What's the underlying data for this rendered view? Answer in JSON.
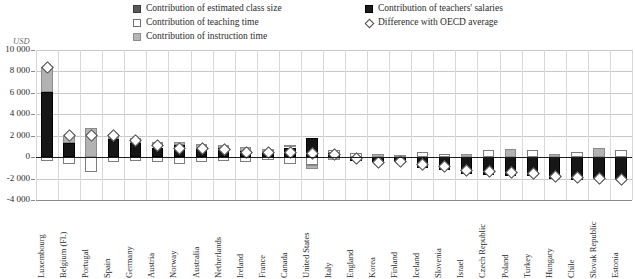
{
  "legend": {
    "items": [
      {
        "id": "class-size",
        "label": "Contribution of estimated class size",
        "swatch": "class"
      },
      {
        "id": "teaching-time",
        "label": "Contribution of teaching time",
        "swatch": "teach"
      },
      {
        "id": "instruction-time",
        "label": "Contribution of instruction time",
        "swatch": "instr"
      },
      {
        "id": "salaries",
        "label": "Contribution of teachers' salaries",
        "swatch": "sal"
      },
      {
        "id": "oecd-diff",
        "label": "Difference with OECD average",
        "swatch": "diamond"
      }
    ]
  },
  "axis": {
    "unit": "USD",
    "yticks": [
      "10 000",
      "8 000",
      "6 000",
      "4 000",
      "2 000",
      "0",
      "-2 000",
      "-4 000"
    ]
  },
  "colors": {
    "class_size": "#5b5b5b",
    "teaching_time": "#fdfdfd",
    "instruction_time": "#b2b2b2",
    "salaries": "#161616",
    "zero_line": "#1d1d1d",
    "gridline": "#c8c8c8"
  },
  "chart_data": {
    "type": "bar",
    "title": "",
    "xlabel": "",
    "ylabel": "USD",
    "ylim": [
      -4000,
      10000
    ],
    "ytick_step": 2000,
    "grid": true,
    "legend_position": "top",
    "stacked": true,
    "categories": [
      "Luxembourg",
      "Belgium (Fl.)",
      "Portugal",
      "Spain",
      "Germany",
      "Austria",
      "Norway",
      "Australia",
      "Netherlands",
      "Ireland",
      "France",
      "Canada",
      "United States",
      "Italy",
      "England",
      "Korea",
      "Finland",
      "Iceland",
      "Slovenia",
      "Israel",
      "Czech Republic",
      "Poland",
      "Turkey",
      "Hungary",
      "Chile",
      "Slovak Republic",
      "Estonia"
    ],
    "series": [
      {
        "name": "Contribution of teachers' salaries",
        "key": "salaries",
        "values": [
          6050,
          1050,
          420,
          1600,
          1900,
          780,
          1150,
          700,
          800,
          480,
          350,
          900,
          1750,
          180,
          -120,
          -430,
          -330,
          -700,
          -900,
          -1400,
          -1350,
          -1550,
          -1300,
          -1700,
          -1800,
          -1750,
          -1700
        ]
      },
      {
        "name": "Contribution of estimated class size",
        "key": "class_size",
        "values": [
          0,
          0,
          0,
          0,
          0,
          0,
          0,
          0,
          0,
          0,
          0,
          0,
          0,
          0,
          0,
          0,
          0,
          0,
          0,
          0,
          0,
          0,
          0,
          0,
          0,
          0,
          0
        ]
      },
      {
        "name": "Contribution of instruction time",
        "key": "instruction_time",
        "values": [
          2350,
          480,
          2350,
          450,
          260,
          620,
          330,
          430,
          300,
          300,
          260,
          260,
          -430,
          300,
          170,
          200,
          200,
          -200,
          280,
          600,
          -620,
          250,
          -250,
          -200,
          -600,
          180,
          -300
        ]
      },
      {
        "name": "Contribution of teaching time",
        "key": "teaching_time",
        "values": [
          -380,
          -700,
          -1250,
          -520,
          -430,
          -330,
          -600,
          -380,
          -330,
          -500,
          -250,
          -580,
          -700,
          150,
          -300,
          180,
          -250,
          200,
          -250,
          400,
          380,
          300,
          280,
          -280,
          420,
          -480,
          -330
        ]
      }
    ],
    "oecd_difference": [
      8400,
      2000,
      2050,
      2050,
      1600,
      1100,
      900,
      820,
      780,
      520,
      450,
      450,
      400,
      250,
      -100,
      -430,
      -400,
      -600,
      -850,
      -1200,
      -1300,
      -1350,
      -1450,
      -1750,
      -1850,
      -1900,
      -2050
    ]
  },
  "bars": [
    {
      "country": "Luxembourg",
      "segments": [
        {
          "key": "salaries",
          "from": 0,
          "to": 6050
        },
        {
          "key": "instruction_time",
          "from": 6050,
          "to": 8400
        },
        {
          "key": "teaching_time",
          "from": 0,
          "to": -400
        }
      ],
      "marker": 8400
    },
    {
      "country": "Belgium (Fl.)",
      "segments": [
        {
          "key": "salaries",
          "from": 0,
          "to": 1300
        },
        {
          "key": "instruction_time",
          "from": 1300,
          "to": 2100
        },
        {
          "key": "teaching_time",
          "from": 0,
          "to": -650
        }
      ],
      "marker": 2050
    },
    {
      "country": "Portugal",
      "segments": [
        {
          "key": "instruction_time",
          "from": 0,
          "to": 2750
        },
        {
          "key": "teaching_time",
          "from": 0,
          "to": -1400
        }
      ],
      "marker": 2050
    },
    {
      "country": "Spain",
      "segments": [
        {
          "key": "salaries",
          "from": 0,
          "to": 1700
        },
        {
          "key": "instruction_time",
          "from": 1700,
          "to": 2150
        },
        {
          "key": "teaching_time",
          "from": 0,
          "to": -500
        }
      ],
      "marker": 2050
    },
    {
      "country": "Germany",
      "segments": [
        {
          "key": "salaries",
          "from": 0,
          "to": 1300
        },
        {
          "key": "instruction_time",
          "from": 1300,
          "to": 1750
        },
        {
          "key": "teaching_time",
          "from": 0,
          "to": -400
        }
      ],
      "marker": 1600
    },
    {
      "country": "Austria",
      "segments": [
        {
          "key": "salaries",
          "from": 0,
          "to": 900
        },
        {
          "key": "instruction_time",
          "from": 900,
          "to": 1400
        },
        {
          "key": "teaching_time",
          "from": 0,
          "to": -500
        }
      ],
      "marker": 1100
    },
    {
      "country": "Norway",
      "segments": [
        {
          "key": "salaries",
          "from": 0,
          "to": 1150
        },
        {
          "key": "instruction_time",
          "from": 1150,
          "to": 1450
        },
        {
          "key": "teaching_time",
          "from": 0,
          "to": -600
        }
      ],
      "marker": 900
    },
    {
      "country": "Australia",
      "segments": [
        {
          "key": "salaries",
          "from": 0,
          "to": 750
        },
        {
          "key": "instruction_time",
          "from": 750,
          "to": 1200
        },
        {
          "key": "teaching_time",
          "from": 0,
          "to": -420
        }
      ],
      "marker": 820
    },
    {
      "country": "Netherlands",
      "segments": [
        {
          "key": "salaries",
          "from": 0,
          "to": 850
        },
        {
          "key": "instruction_time",
          "from": 850,
          "to": 1150
        },
        {
          "key": "teaching_time",
          "from": 0,
          "to": -380
        }
      ],
      "marker": 780
    },
    {
      "country": "Ireland",
      "segments": [
        {
          "key": "salaries",
          "from": 0,
          "to": 600
        },
        {
          "key": "instruction_time",
          "from": 600,
          "to": 950
        },
        {
          "key": "teaching_time",
          "from": 0,
          "to": -500
        }
      ],
      "marker": 520
    },
    {
      "country": "France",
      "segments": [
        {
          "key": "salaries",
          "from": 0,
          "to": 500
        },
        {
          "key": "instruction_time",
          "from": 500,
          "to": 800
        },
        {
          "key": "teaching_time",
          "from": 0,
          "to": -300
        }
      ],
      "marker": 450
    },
    {
      "country": "Canada",
      "segments": [
        {
          "key": "salaries",
          "from": 0,
          "to": 900
        },
        {
          "key": "instruction_time",
          "from": 900,
          "to": 1150
        },
        {
          "key": "teaching_time",
          "from": 0,
          "to": -600
        }
      ],
      "marker": 450
    },
    {
      "country": "United States",
      "segments": [
        {
          "key": "salaries",
          "from": 0,
          "to": 1750
        },
        {
          "key": "teaching_time",
          "from": 0,
          "to": -700
        },
        {
          "key": "instruction_time",
          "from": -700,
          "to": -1100
        }
      ],
      "marker": 400
    },
    {
      "country": "Italy",
      "segments": [
        {
          "key": "salaries",
          "from": 0,
          "to": 350
        },
        {
          "key": "teaching_time",
          "from": 350,
          "to": 650
        },
        {
          "key": "instruction_time",
          "from": 0,
          "to": -250
        }
      ],
      "marker": 250
    },
    {
      "country": "England",
      "segments": [
        {
          "key": "teaching_time",
          "from": 0,
          "to": 420
        },
        {
          "key": "salaries",
          "from": 0,
          "to": -400
        }
      ],
      "marker": -100
    },
    {
      "country": "Korea",
      "segments": [
        {
          "key": "instruction_time",
          "from": 0,
          "to": 330
        },
        {
          "key": "salaries",
          "from": 0,
          "to": -500
        }
      ],
      "marker": -430
    },
    {
      "country": "Finland",
      "segments": [
        {
          "key": "instruction_time",
          "from": 0,
          "to": 200
        },
        {
          "key": "salaries",
          "from": 0,
          "to": -450
        }
      ],
      "marker": -400
    },
    {
      "country": "Iceland",
      "segments": [
        {
          "key": "teaching_time",
          "from": 0,
          "to": 500
        },
        {
          "key": "salaries",
          "from": 0,
          "to": -1000
        }
      ],
      "marker": -600
    },
    {
      "country": "Slovenia",
      "segments": [
        {
          "key": "teaching_time",
          "from": 0,
          "to": 300
        },
        {
          "key": "salaries",
          "from": 0,
          "to": -1200
        }
      ],
      "marker": -850
    },
    {
      "country": "Israel",
      "segments": [
        {
          "key": "instruction_time",
          "from": 0,
          "to": 300
        },
        {
          "key": "salaries",
          "from": 0,
          "to": -1600
        }
      ],
      "marker": -1200
    },
    {
      "country": "Czech Republic",
      "segments": [
        {
          "key": "teaching_time",
          "from": 0,
          "to": 700
        },
        {
          "key": "salaries",
          "from": 0,
          "to": -1700
        }
      ],
      "marker": -1300
    },
    {
      "country": "Poland",
      "segments": [
        {
          "key": "instruction_time",
          "from": 0,
          "to": 750
        },
        {
          "key": "salaries",
          "from": 0,
          "to": -1750
        }
      ],
      "marker": -1350
    },
    {
      "country": "Turkey",
      "segments": [
        {
          "key": "teaching_time",
          "from": 0,
          "to": 700
        },
        {
          "key": "salaries",
          "from": 0,
          "to": -1800
        }
      ],
      "marker": -1450
    },
    {
      "country": "Hungary",
      "segments": [
        {
          "key": "instruction_time",
          "from": 0,
          "to": 250
        },
        {
          "key": "salaries",
          "from": 0,
          "to": -2000
        }
      ],
      "marker": -1750
    },
    {
      "country": "Chile",
      "segments": [
        {
          "key": "teaching_time",
          "from": 0,
          "to": 500
        },
        {
          "key": "salaries",
          "from": 0,
          "to": -2100
        }
      ],
      "marker": -1850
    },
    {
      "country": "Slovak Republic",
      "segments": [
        {
          "key": "instruction_time",
          "from": 0,
          "to": 900
        },
        {
          "key": "salaries",
          "from": 0,
          "to": -2050
        }
      ],
      "marker": -1900
    },
    {
      "country": "Estonia",
      "segments": [
        {
          "key": "teaching_time",
          "from": 0,
          "to": 650
        },
        {
          "key": "salaries",
          "from": 0,
          "to": -2150
        }
      ],
      "marker": -2050
    }
  ]
}
